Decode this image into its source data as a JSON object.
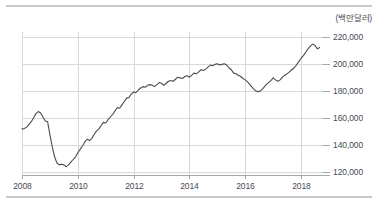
{
  "unit_note": "(백만달러)",
  "colors": {
    "line": "#4a4a52",
    "grid": "#d8d8dc",
    "axis": "#a8a8ae",
    "rule": "#c9c9cc",
    "text": "#4a4a52"
  },
  "chart_data": {
    "type": "line",
    "title": "",
    "subtitle": "",
    "xlabel": "",
    "ylabel": "",
    "unit": "(백만달러)",
    "grid": true,
    "legend": "none",
    "xlim": [
      2008.0,
      2018.75
    ],
    "ylim": [
      118000,
      224000
    ],
    "ytick_labels": [
      "220,000",
      "200,000",
      "180,000",
      "160,000",
      "140,000",
      "120,000"
    ],
    "ytick_values": [
      220000,
      200000,
      180000,
      160000,
      140000,
      120000
    ],
    "xtick_labels": [
      "2008",
      "2010",
      "2012",
      "2014",
      "2016",
      "2018"
    ],
    "xtick_values": [
      2008,
      2010,
      2012,
      2014,
      2016,
      2018
    ],
    "series": [
      {
        "name": "금액",
        "x": [
          2008.0,
          2008.083,
          2008.167,
          2008.25,
          2008.333,
          2008.417,
          2008.5,
          2008.583,
          2008.667,
          2008.75,
          2008.833,
          2008.917,
          2009.0,
          2009.083,
          2009.167,
          2009.25,
          2009.333,
          2009.417,
          2009.5,
          2009.583,
          2009.667,
          2009.75,
          2009.833,
          2009.917,
          2010.0,
          2010.083,
          2010.167,
          2010.25,
          2010.333,
          2010.417,
          2010.5,
          2010.583,
          2010.667,
          2010.75,
          2010.833,
          2010.917,
          2011.0,
          2011.083,
          2011.167,
          2011.25,
          2011.333,
          2011.417,
          2011.5,
          2011.583,
          2011.667,
          2011.75,
          2011.833,
          2011.917,
          2012.0,
          2012.083,
          2012.167,
          2012.25,
          2012.333,
          2012.417,
          2012.5,
          2012.583,
          2012.667,
          2012.75,
          2012.833,
          2012.917,
          2013.0,
          2013.083,
          2013.167,
          2013.25,
          2013.333,
          2013.417,
          2013.5,
          2013.583,
          2013.667,
          2013.75,
          2013.833,
          2013.917,
          2014.0,
          2014.083,
          2014.167,
          2014.25,
          2014.333,
          2014.417,
          2014.5,
          2014.583,
          2014.667,
          2014.75,
          2014.833,
          2014.917,
          2015.0,
          2015.083,
          2015.167,
          2015.25,
          2015.333,
          2015.417,
          2015.5,
          2015.583,
          2015.667,
          2015.75,
          2015.833,
          2015.917,
          2016.0,
          2016.083,
          2016.167,
          2016.25,
          2016.333,
          2016.417,
          2016.5,
          2016.583,
          2016.667,
          2016.75,
          2016.833,
          2016.917,
          2017.0,
          2017.083,
          2017.167,
          2017.25,
          2017.333,
          2017.417,
          2017.5,
          2017.583,
          2017.667,
          2017.75,
          2017.833,
          2017.917,
          2018.0,
          2018.083,
          2018.167,
          2018.25,
          2018.333,
          2018.417,
          2018.5,
          2018.583,
          2018.667
        ],
        "values": [
          152000,
          152500,
          153500,
          155500,
          157500,
          160500,
          163500,
          165000,
          164000,
          161000,
          158000,
          157500,
          148000,
          139000,
          131500,
          127000,
          125500,
          126000,
          125500,
          124200,
          125500,
          127500,
          129500,
          131500,
          134500,
          137000,
          139500,
          142500,
          144500,
          143500,
          145000,
          148000,
          150500,
          152000,
          154500,
          157000,
          156500,
          159000,
          161000,
          163000,
          165500,
          168000,
          167500,
          170000,
          172500,
          175000,
          175500,
          178000,
          179500,
          179000,
          181000,
          182500,
          183500,
          183000,
          184500,
          185000,
          184500,
          183500,
          185000,
          186500,
          186000,
          184500,
          186000,
          187500,
          188000,
          187500,
          189000,
          190500,
          190000,
          189500,
          191000,
          191500,
          190500,
          192000,
          193500,
          193000,
          194500,
          196000,
          195500,
          196500,
          198000,
          199500,
          199000,
          200000,
          200500,
          199500,
          200000,
          200500,
          199500,
          197500,
          196000,
          193500,
          193000,
          192000,
          191000,
          189500,
          188500,
          187000,
          185000,
          183000,
          181000,
          180000,
          179800,
          181000,
          183000,
          185000,
          186500,
          188000,
          190000,
          188500,
          187500,
          188500,
          190500,
          192000,
          193000,
          194500,
          196000,
          197500,
          199500,
          202000,
          204500,
          206500,
          209000,
          211500,
          213500,
          215000,
          214000,
          211500,
          212500
        ]
      }
    ]
  }
}
